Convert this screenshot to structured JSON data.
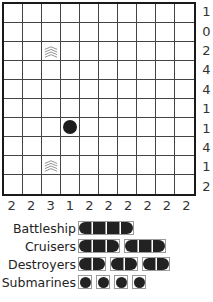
{
  "puzzle": {
    "grid_size": 10,
    "row_clues": [
      "1",
      "0",
      "2",
      "4",
      "4",
      "1",
      "1",
      "4",
      "1",
      "2"
    ],
    "col_clues": [
      "2",
      "2",
      "3",
      "1",
      "2",
      "2",
      "2",
      "2",
      "2",
      "2"
    ],
    "given_cells": [
      {
        "row": 2,
        "col": 2,
        "type": "water",
        "icon": "waves-icon"
      },
      {
        "row": 6,
        "col": 3,
        "type": "submarine",
        "icon": "submarine-icon"
      },
      {
        "row": 8,
        "col": 2,
        "type": "water",
        "icon": "waves-icon"
      }
    ]
  },
  "legend": {
    "rows": [
      {
        "label": "Battleship",
        "ships": [
          4
        ]
      },
      {
        "label": "Cruisers",
        "ships": [
          3,
          3
        ]
      },
      {
        "label": "Destroyers",
        "ships": [
          2,
          2,
          2
        ]
      },
      {
        "label": "Submarines",
        "ships": [
          1,
          1,
          1,
          1
        ]
      }
    ]
  },
  "colors": {
    "grid_line": "#444444",
    "ship_fill": "#222222",
    "legend_border": "#9a9a9a",
    "background": "#ffffff"
  }
}
